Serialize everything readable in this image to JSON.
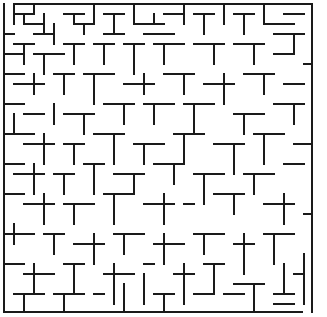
{
  "maze": {
    "width": 327,
    "height": 317,
    "cell_size": 10,
    "origin": [
      4,
      4
    ],
    "cols": 31,
    "rows": 31,
    "wall_color": "#1a1a1a",
    "background": "#ffffff",
    "entrance": {
      "side": "top",
      "x1": 4,
      "x2": 14
    },
    "exit": {
      "side": "bottom",
      "x1": 302,
      "x2": 312
    },
    "border": [
      [
        14,
        4,
        312,
        4
      ],
      [
        312,
        4,
        312,
        312
      ],
      [
        4,
        4,
        4,
        312
      ],
      [
        4,
        312,
        302,
        312
      ]
    ],
    "walls": [
      [
        14,
        4,
        14,
        24
      ],
      [
        14,
        14,
        34,
        14
      ],
      [
        24,
        14,
        24,
        24
      ],
      [
        34,
        4,
        34,
        14
      ],
      [
        24,
        24,
        44,
        24
      ],
      [
        44,
        14,
        44,
        34
      ],
      [
        34,
        34,
        54,
        34
      ],
      [
        54,
        24,
        54,
        44
      ],
      [
        64,
        14,
        84,
        14
      ],
      [
        74,
        14,
        74,
        24
      ],
      [
        74,
        24,
        94,
        24
      ],
      [
        84,
        24,
        84,
        34
      ],
      [
        94,
        4,
        94,
        24
      ],
      [
        104,
        14,
        124,
        14
      ],
      [
        114,
        14,
        114,
        34
      ],
      [
        104,
        34,
        124,
        34
      ],
      [
        134,
        4,
        134,
        24
      ],
      [
        134,
        24,
        164,
        24
      ],
      [
        154,
        14,
        154,
        24
      ],
      [
        144,
        34,
        174,
        34
      ],
      [
        164,
        14,
        184,
        14
      ],
      [
        184,
        4,
        184,
        24
      ],
      [
        194,
        14,
        214,
        14
      ],
      [
        204,
        14,
        204,
        34
      ],
      [
        224,
        4,
        224,
        24
      ],
      [
        234,
        14,
        254,
        14
      ],
      [
        244,
        14,
        244,
        34
      ],
      [
        264,
        4,
        264,
        24
      ],
      [
        264,
        24,
        294,
        24
      ],
      [
        284,
        14,
        304,
        14
      ],
      [
        274,
        34,
        304,
        34
      ],
      [
        294,
        34,
        294,
        54
      ],
      [
        4,
        34,
        14,
        34
      ],
      [
        14,
        44,
        34,
        44
      ],
      [
        24,
        44,
        24,
        64
      ],
      [
        4,
        54,
        24,
        54
      ],
      [
        34,
        54,
        64,
        54
      ],
      [
        44,
        54,
        44,
        74
      ],
      [
        64,
        44,
        84,
        44
      ],
      [
        74,
        44,
        74,
        64
      ],
      [
        94,
        44,
        114,
        44
      ],
      [
        104,
        44,
        104,
        64
      ],
      [
        124,
        44,
        144,
        44
      ],
      [
        134,
        44,
        134,
        74
      ],
      [
        154,
        44,
        184,
        44
      ],
      [
        164,
        44,
        164,
        64
      ],
      [
        194,
        44,
        224,
        44
      ],
      [
        214,
        44,
        214,
        64
      ],
      [
        234,
        44,
        264,
        44
      ],
      [
        254,
        44,
        254,
        64
      ],
      [
        274,
        54,
        294,
        54
      ],
      [
        304,
        64,
        312,
        64
      ],
      [
        4,
        74,
        24,
        74
      ],
      [
        14,
        84,
        44,
        84
      ],
      [
        34,
        74,
        34,
        94
      ],
      [
        54,
        74,
        74,
        74
      ],
      [
        64,
        74,
        64,
        94
      ],
      [
        84,
        74,
        114,
        74
      ],
      [
        94,
        74,
        94,
        104
      ],
      [
        124,
        84,
        154,
        84
      ],
      [
        144,
        74,
        144,
        94
      ],
      [
        164,
        74,
        194,
        74
      ],
      [
        184,
        74,
        184,
        94
      ],
      [
        204,
        84,
        234,
        84
      ],
      [
        224,
        74,
        224,
        104
      ],
      [
        244,
        74,
        274,
        74
      ],
      [
        264,
        74,
        264,
        94
      ],
      [
        284,
        84,
        304,
        84
      ],
      [
        4,
        104,
        24,
        104
      ],
      [
        14,
        114,
        14,
        134
      ],
      [
        24,
        114,
        44,
        114
      ],
      [
        54,
        104,
        54,
        124
      ],
      [
        64,
        114,
        94,
        114
      ],
      [
        84,
        114,
        84,
        134
      ],
      [
        104,
        104,
        134,
        104
      ],
      [
        124,
        104,
        124,
        124
      ],
      [
        144,
        104,
        174,
        104
      ],
      [
        154,
        104,
        154,
        124
      ],
      [
        184,
        104,
        214,
        104
      ],
      [
        194,
        104,
        194,
        134
      ],
      [
        234,
        114,
        264,
        114
      ],
      [
        244,
        114,
        244,
        134
      ],
      [
        274,
        104,
        304,
        104
      ],
      [
        294,
        104,
        294,
        124
      ],
      [
        4,
        134,
        34,
        134
      ],
      [
        24,
        144,
        54,
        144
      ],
      [
        44,
        134,
        44,
        164
      ],
      [
        64,
        144,
        84,
        144
      ],
      [
        74,
        144,
        74,
        164
      ],
      [
        94,
        134,
        124,
        134
      ],
      [
        114,
        134,
        114,
        164
      ],
      [
        134,
        144,
        164,
        144
      ],
      [
        144,
        144,
        144,
        164
      ],
      [
        174,
        134,
        204,
        134
      ],
      [
        184,
        134,
        184,
        164
      ],
      [
        214,
        144,
        244,
        144
      ],
      [
        234,
        144,
        234,
        174
      ],
      [
        254,
        134,
        284,
        134
      ],
      [
        264,
        134,
        264,
        164
      ],
      [
        294,
        144,
        312,
        144
      ],
      [
        4,
        164,
        24,
        164
      ],
      [
        14,
        174,
        44,
        174
      ],
      [
        34,
        164,
        34,
        194
      ],
      [
        54,
        174,
        74,
        174
      ],
      [
        64,
        174,
        64,
        194
      ],
      [
        84,
        164,
        104,
        164
      ],
      [
        94,
        164,
        94,
        194
      ],
      [
        114,
        174,
        144,
        174
      ],
      [
        134,
        174,
        134,
        194
      ],
      [
        154,
        164,
        184,
        164
      ],
      [
        174,
        164,
        174,
        184
      ],
      [
        194,
        174,
        224,
        174
      ],
      [
        204,
        174,
        204,
        204
      ],
      [
        244,
        174,
        274,
        174
      ],
      [
        254,
        174,
        254,
        194
      ],
      [
        284,
        164,
        304,
        164
      ],
      [
        4,
        194,
        24,
        194
      ],
      [
        24,
        204,
        54,
        204
      ],
      [
        44,
        194,
        44,
        224
      ],
      [
        64,
        204,
        94,
        204
      ],
      [
        74,
        204,
        74,
        224
      ],
      [
        104,
        194,
        134,
        194
      ],
      [
        114,
        194,
        114,
        224
      ],
      [
        144,
        204,
        174,
        204
      ],
      [
        164,
        194,
        164,
        224
      ],
      [
        184,
        204,
        194,
        204
      ],
      [
        214,
        194,
        244,
        194
      ],
      [
        234,
        194,
        234,
        214
      ],
      [
        264,
        204,
        294,
        204
      ],
      [
        284,
        194,
        284,
        224
      ],
      [
        304,
        214,
        312,
        214
      ],
      [
        4,
        234,
        34,
        234
      ],
      [
        14,
        224,
        14,
        244
      ],
      [
        44,
        234,
        64,
        234
      ],
      [
        54,
        234,
        54,
        254
      ],
      [
        74,
        244,
        104,
        244
      ],
      [
        94,
        234,
        94,
        264
      ],
      [
        114,
        234,
        144,
        234
      ],
      [
        124,
        234,
        124,
        254
      ],
      [
        154,
        244,
        184,
        244
      ],
      [
        164,
        234,
        164,
        264
      ],
      [
        194,
        234,
        224,
        234
      ],
      [
        204,
        234,
        204,
        254
      ],
      [
        234,
        244,
        254,
        244
      ],
      [
        244,
        234,
        244,
        274
      ],
      [
        264,
        234,
        294,
        234
      ],
      [
        274,
        234,
        274,
        264
      ],
      [
        4,
        264,
        24,
        264
      ],
      [
        24,
        274,
        54,
        274
      ],
      [
        34,
        264,
        34,
        294
      ],
      [
        64,
        264,
        84,
        264
      ],
      [
        74,
        264,
        74,
        294
      ],
      [
        104,
        274,
        134,
        274
      ],
      [
        114,
        264,
        114,
        304
      ],
      [
        144,
        264,
        154,
        264
      ],
      [
        144,
        274,
        144,
        304
      ],
      [
        174,
        274,
        194,
        274
      ],
      [
        184,
        264,
        184,
        304
      ],
      [
        204,
        264,
        224,
        264
      ],
      [
        214,
        264,
        214,
        294
      ],
      [
        234,
        284,
        264,
        284
      ],
      [
        254,
        284,
        254,
        312
      ],
      [
        284,
        264,
        284,
        294
      ],
      [
        294,
        274,
        304,
        274
      ],
      [
        304,
        254,
        304,
        304
      ],
      [
        14,
        294,
        44,
        294
      ],
      [
        24,
        294,
        24,
        312
      ],
      [
        54,
        294,
        84,
        294
      ],
      [
        64,
        294,
        64,
        312
      ],
      [
        94,
        294,
        104,
        294
      ],
      [
        124,
        284,
        124,
        312
      ],
      [
        154,
        294,
        174,
        294
      ],
      [
        164,
        294,
        164,
        312
      ],
      [
        194,
        294,
        214,
        294
      ],
      [
        224,
        294,
        244,
        294
      ],
      [
        274,
        294,
        294,
        294
      ],
      [
        274,
        304,
        294,
        304
      ]
    ]
  }
}
